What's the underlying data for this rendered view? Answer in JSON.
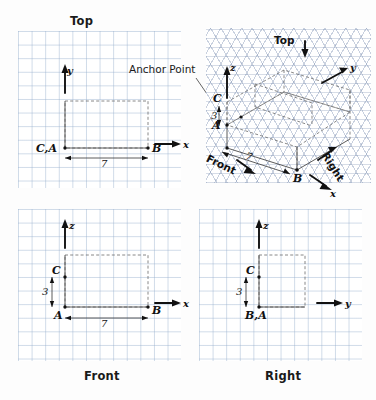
{
  "drawing": {
    "title_top": "Top",
    "title_front": "Front",
    "title_right": "Right",
    "annotation_anchor": "Anchor Point"
  },
  "views": {
    "top": {
      "name": "Top",
      "axis_vertical": "y",
      "axis_horizontal": "x",
      "point_origin": "C,A",
      "point_right": "B",
      "dimension_width": "7"
    },
    "front": {
      "name": "Front",
      "axis_vertical": "z",
      "axis_horizontal": "x",
      "point_origin": "A",
      "point_upper": "C",
      "point_right": "B",
      "dimension_width": "7",
      "dimension_height": "3"
    },
    "right": {
      "name": "Right",
      "axis_vertical": "z",
      "axis_horizontal": "y",
      "point_origin": "B,A",
      "point_upper": "C",
      "dimension_height": "3"
    },
    "isometric": {
      "axis_z": "z",
      "axis_y": "y",
      "axis_x": "x",
      "point_a": "A",
      "point_b": "B",
      "point_c": "C",
      "dimension_height": "3",
      "dimension_width": "7",
      "face_top": "Top",
      "face_front": "Front",
      "face_right": "Right"
    }
  },
  "colors": {
    "grid": "#96afcd",
    "iso_grid": "#788caf",
    "object_line": "#4a4a4a",
    "axis": "#111111",
    "text": "#1a1a1a",
    "background": "#fdfdfd"
  }
}
